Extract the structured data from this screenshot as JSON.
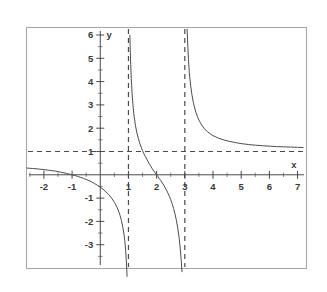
{
  "chart_data": {
    "type": "line",
    "title": "",
    "subtitle": "",
    "xlabel": "x",
    "ylabel": "y",
    "xlim": [
      -2.6,
      7.3
    ],
    "ylim": [
      -4.0,
      6.3
    ],
    "grid": false,
    "legend": "none",
    "x_ticks": [
      -2,
      -1,
      1,
      2,
      3,
      4,
      5,
      6,
      7
    ],
    "x_tick_labels": [
      "-2",
      "-1",
      "1",
      "2",
      "3",
      "4",
      "5",
      "6",
      "7"
    ],
    "y_ticks": [
      -3,
      -2,
      -1,
      1,
      2,
      3,
      4,
      5,
      6
    ],
    "y_tick_labels": [
      "-3",
      "-2",
      "-1",
      "1",
      "2",
      "3",
      "4",
      "5",
      "6"
    ],
    "minor_tick_step": 0.5,
    "annotations": {
      "vertical_asymptotes": [
        1,
        3
      ],
      "horizontal_asymptote": 1,
      "x_intercepts": [
        -1,
        2
      ],
      "y_intercept": -0.667
    },
    "series": [
      {
        "name": "left-branch",
        "comment": "x from -2.6 up to just left of asymptote x=1",
        "points": [
          [
            -2.6,
            0.29
          ],
          [
            -2.4,
            0.27
          ],
          [
            -2.2,
            0.25
          ],
          [
            -2.0,
            0.22
          ],
          [
            -1.8,
            0.19
          ],
          [
            -1.6,
            0.16
          ],
          [
            -1.4,
            0.11
          ],
          [
            -1.2,
            0.06
          ],
          [
            -1.0,
            0.0
          ],
          [
            -0.9,
            -0.03
          ],
          [
            -0.8,
            -0.07
          ],
          [
            -0.7,
            -0.11
          ],
          [
            -0.6,
            -0.15
          ],
          [
            -0.5,
            -0.2
          ],
          [
            -0.4,
            -0.25
          ],
          [
            -0.3,
            -0.31
          ],
          [
            -0.2,
            -0.38
          ],
          [
            -0.1,
            -0.45
          ],
          [
            0.0,
            -0.53
          ],
          [
            0.1,
            -0.62
          ],
          [
            0.2,
            -0.73
          ],
          [
            0.3,
            -0.85
          ],
          [
            0.4,
            -1.0
          ],
          [
            0.5,
            -1.18
          ],
          [
            0.55,
            -1.29
          ],
          [
            0.6,
            -1.41
          ],
          [
            0.65,
            -1.56
          ],
          [
            0.7,
            -1.74
          ],
          [
            0.75,
            -1.96
          ],
          [
            0.8,
            -2.25
          ],
          [
            0.84,
            -2.54
          ],
          [
            0.87,
            -2.83
          ],
          [
            0.9,
            -3.24
          ],
          [
            0.92,
            -3.6
          ],
          [
            0.94,
            -4.07
          ],
          [
            0.95,
            -4.36
          ]
        ]
      },
      {
        "name": "middle-branch",
        "comment": "between asymptotes x=1 and x=3, decreasing through (2,0)",
        "points": [
          [
            1.05,
            5.99
          ],
          [
            1.06,
            5.52
          ],
          [
            1.08,
            4.73
          ],
          [
            1.1,
            4.14
          ],
          [
            1.13,
            3.48
          ],
          [
            1.16,
            2.99
          ],
          [
            1.2,
            2.52
          ],
          [
            1.25,
            2.1
          ],
          [
            1.3,
            1.8
          ],
          [
            1.35,
            1.56
          ],
          [
            1.4,
            1.36
          ],
          [
            1.45,
            1.19
          ],
          [
            1.5,
            1.04
          ],
          [
            1.55,
            0.9
          ],
          [
            1.6,
            0.78
          ],
          [
            1.65,
            0.67
          ],
          [
            1.7,
            0.56
          ],
          [
            1.75,
            0.45
          ],
          [
            1.8,
            0.35
          ],
          [
            1.85,
            0.25
          ],
          [
            1.9,
            0.16
          ],
          [
            1.95,
            0.08
          ],
          [
            2.0,
            0.0
          ],
          [
            2.05,
            -0.08
          ],
          [
            2.1,
            -0.17
          ],
          [
            2.15,
            -0.25
          ],
          [
            2.2,
            -0.35
          ],
          [
            2.25,
            -0.44
          ],
          [
            2.3,
            -0.55
          ],
          [
            2.35,
            -0.66
          ],
          [
            2.4,
            -0.78
          ],
          [
            2.45,
            -0.92
          ],
          [
            2.5,
            -1.07
          ],
          [
            2.55,
            -1.24
          ],
          [
            2.6,
            -1.44
          ],
          [
            2.65,
            -1.67
          ],
          [
            2.7,
            -1.95
          ],
          [
            2.75,
            -2.29
          ],
          [
            2.8,
            -2.73
          ],
          [
            2.84,
            -3.19
          ],
          [
            2.87,
            -3.64
          ],
          [
            2.9,
            -4.16
          ]
        ]
      },
      {
        "name": "right-branch",
        "comment": "right of asymptote x=3, decreasing toward y=1",
        "points": [
          [
            3.08,
            6.25
          ],
          [
            3.1,
            5.7
          ],
          [
            3.13,
            4.94
          ],
          [
            3.16,
            4.38
          ],
          [
            3.2,
            3.9
          ],
          [
            3.25,
            3.45
          ],
          [
            3.3,
            3.12
          ],
          [
            3.35,
            2.87
          ],
          [
            3.4,
            2.66
          ],
          [
            3.45,
            2.49
          ],
          [
            3.5,
            2.35
          ],
          [
            3.6,
            2.13
          ],
          [
            3.7,
            1.97
          ],
          [
            3.8,
            1.85
          ],
          [
            3.9,
            1.76
          ],
          [
            4.0,
            1.68
          ],
          [
            4.2,
            1.57
          ],
          [
            4.4,
            1.49
          ],
          [
            4.6,
            1.43
          ],
          [
            4.8,
            1.38
          ],
          [
            5.0,
            1.34
          ],
          [
            5.25,
            1.3
          ],
          [
            5.5,
            1.27
          ],
          [
            5.75,
            1.25
          ],
          [
            6.0,
            1.23
          ],
          [
            6.25,
            1.21
          ],
          [
            6.5,
            1.2
          ],
          [
            6.75,
            1.19
          ],
          [
            7.0,
            1.18
          ],
          [
            7.2,
            1.17
          ]
        ]
      }
    ]
  },
  "colors": {
    "curve": "#4d4d4d",
    "axis": "#4a4a4a",
    "asymptote": "#4a4a4a",
    "frame": "#a8a8a8",
    "background": "#ffffff",
    "label": "#3a3a3a"
  }
}
